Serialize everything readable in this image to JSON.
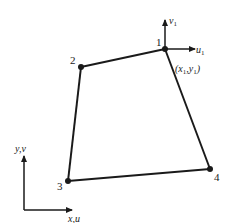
{
  "diagram": {
    "type": "quadrilateral-finite-element",
    "colors": {
      "stroke": "#1a1a1a",
      "background": "#ffffff"
    },
    "nodes": [
      {
        "id": "1",
        "label": "1",
        "x": 165,
        "y": 49
      },
      {
        "id": "2",
        "label": "2",
        "x": 81,
        "y": 67
      },
      {
        "id": "3",
        "label": "3",
        "x": 68,
        "y": 181
      },
      {
        "id": "4",
        "label": "4",
        "x": 210,
        "y": 169
      }
    ],
    "edges": [
      [
        "1",
        "2"
      ],
      [
        "2",
        "3"
      ],
      [
        "3",
        "4"
      ],
      [
        "4",
        "1"
      ]
    ],
    "local_axes": {
      "node": "1",
      "horizontal": {
        "var": "u",
        "sub": "1"
      },
      "vertical": {
        "var": "v",
        "sub": "1"
      },
      "coord_label": {
        "open": "(",
        "x": "x",
        "xsub": "1",
        "sep": ",",
        "y": "y",
        "ysub": "1",
        "close": ")"
      }
    },
    "global_axes": {
      "x_label": "x,u",
      "y_label": "y,v"
    }
  }
}
